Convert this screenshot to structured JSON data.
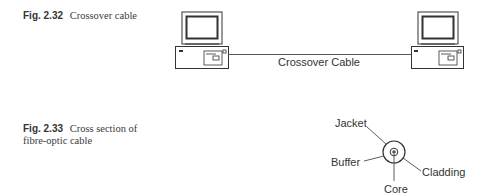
{
  "figures": [
    {
      "number": "Fig. 2.32",
      "caption": "Crossover cable",
      "diagram": {
        "cable_label": "Crossover Cable",
        "devices": [
          "computer-left",
          "computer-right"
        ]
      }
    },
    {
      "number": "Fig. 2.33",
      "caption": "Cross section of fibre-optic cable",
      "diagram": {
        "labels": {
          "jacket": "Jacket",
          "buffer": "Buffer",
          "cladding": "Cladding",
          "core": "Core"
        }
      }
    }
  ]
}
